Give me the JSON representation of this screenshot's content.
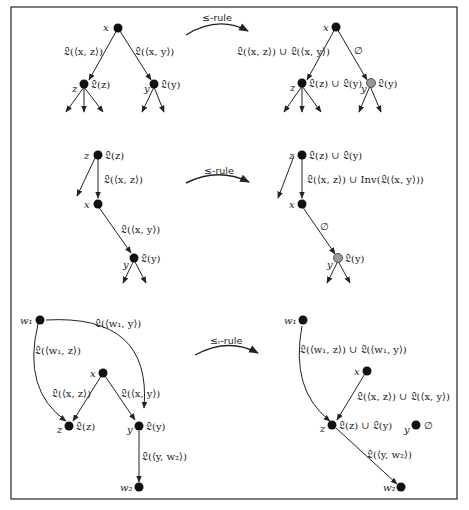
{
  "figure": {
    "rules": [
      {
        "label": "≤-rule"
      },
      {
        "label": "≤-rule"
      },
      {
        "label": "≤ᵣ-rule"
      }
    ],
    "panel1_left": {
      "nodes": {
        "x": "x",
        "z": "z",
        "y": "y"
      },
      "node_labels": {
        "z": "𝔏(z)",
        "y": "𝔏(y)"
      },
      "edge_labels": {
        "xz": "𝔏(⟨x, z⟩)",
        "xy": "𝔏(⟨x, y⟩)"
      }
    },
    "panel1_right": {
      "nodes": {
        "x": "x",
        "z": "z",
        "y": "y"
      },
      "node_labels": {
        "z": "𝔏(z) ∪ 𝔏(y)",
        "y": "𝔏(y)"
      },
      "edge_labels": {
        "xz": "𝔏(⟨x, z⟩) ∪ 𝔏(⟨x, y⟩)",
        "xy": "∅"
      }
    },
    "panel2_left": {
      "nodes": {
        "z": "z",
        "x": "x",
        "y": "y"
      },
      "node_labels": {
        "z": "𝔏(z)",
        "y": "𝔏(y)"
      },
      "edge_labels": {
        "zx": "𝔏(⟨x, z⟩)",
        "xy": "𝔏(⟨x, y⟩)"
      }
    },
    "panel2_right": {
      "nodes": {
        "z": "z",
        "x": "x",
        "y": "y"
      },
      "node_labels": {
        "z": "𝔏(z) ∪ 𝔏(y)",
        "y": "𝔏(y)"
      },
      "edge_labels": {
        "zx": "𝔏(⟨x, z⟩) ∪ Inv(𝔏(⟨x, y⟩))",
        "xy": "∅"
      }
    },
    "panel3_left": {
      "nodes": {
        "w1": "w₁",
        "x": "x",
        "z": "z",
        "y": "y",
        "w2": "w₂"
      },
      "node_labels": {
        "z": "𝔏(z)",
        "y": "𝔏(y)"
      },
      "edge_labels": {
        "w1y": "𝔏(⟨w₁, y⟩)",
        "w1z": "𝔏(⟨w₁, z⟩)",
        "xz": "𝔏(⟨x, z⟩)",
        "xy": "𝔏(⟨x, y⟩)",
        "yw2": "𝔏(⟨y, w₂⟩)"
      }
    },
    "panel3_right": {
      "nodes": {
        "w1": "w₁",
        "x": "x",
        "z": "z",
        "y": "y",
        "w2": "w₂"
      },
      "node_labels": {
        "z": "𝔏(z) ∪ 𝔏(y)",
        "y": "∅"
      },
      "edge_labels": {
        "w1z": "𝔏(⟨w₁, z⟩) ∪ 𝔏(⟨w₁, y⟩)",
        "xz": "𝔏(⟨x, z⟩) ∪ 𝔏(⟨x, y⟩)",
        "zw2": "𝔏(⟨y, w₂⟩)"
      }
    }
  }
}
